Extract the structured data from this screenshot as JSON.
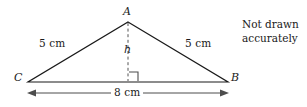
{
  "figure": {
    "type": "isosceles-triangle-geometry-diagram",
    "vertices": {
      "apex_label": "A",
      "right_label": "B",
      "left_label": "C"
    },
    "labels": {
      "side_left": "5 cm",
      "side_right": "5 cm",
      "height": "h",
      "base": "8 cm"
    },
    "note": {
      "line1": "Not drawn",
      "line2": "accurately"
    },
    "colors": {
      "stroke": "#1a1a1a",
      "dashed_stroke": "#555555",
      "dimension_stroke": "#4d4d4d",
      "text": "#1a1a1a",
      "background": "#ffffff"
    },
    "geometry": {
      "apex": [
        128,
        22
      ],
      "left_vertex": [
        28,
        82
      ],
      "right_vertex": [
        228,
        82
      ],
      "foot_of_height": [
        128,
        82
      ],
      "base_length_px": 200,
      "height_px": 60,
      "dimension_line_y": 93
    }
  }
}
